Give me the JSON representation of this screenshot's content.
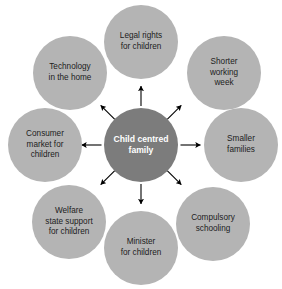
{
  "diagram": {
    "type": "radial-spoke",
    "title_hub": "Child centred\nfamily",
    "hub_name": "child-centred-family",
    "colors": {
      "hub_fill": "#7c7c7c",
      "hub_text": "#ffffff",
      "node_fill": "#b4b4b4",
      "node_text": "#1c1c1c",
      "arrow": "#000000",
      "background": "#ffffff"
    },
    "nodes": [
      {
        "id": "legal-rights-for-children",
        "label": "Legal rights\nfor children",
        "angle_deg": 90,
        "arrow_direction": "outward"
      },
      {
        "id": "shorter-working-week",
        "label": "Shorter\nworking\nweek",
        "angle_deg": 45,
        "arrow_direction": "outward"
      },
      {
        "id": "smaller-families",
        "label": "Smaller\nfamilies",
        "angle_deg": 0,
        "arrow_direction": "outward"
      },
      {
        "id": "compulsory-schooling",
        "label": "Compulsory\nschooling",
        "angle_deg": -45,
        "arrow_direction": "outward"
      },
      {
        "id": "minister-for-children",
        "label": "Minister\nfor children",
        "angle_deg": -90,
        "arrow_direction": "outward"
      },
      {
        "id": "welfare-state-support-for-children",
        "label": "Welfare\nstate support\nfor children",
        "angle_deg": -135,
        "arrow_direction": "outward"
      },
      {
        "id": "consumer-market-for-children",
        "label": "Consumer\nmarket for\nchildren",
        "angle_deg": 180,
        "arrow_direction": "outward"
      },
      {
        "id": "technology-in-the-home",
        "label": "Technology\nin the home",
        "angle_deg": 135,
        "arrow_direction": "outward"
      }
    ],
    "arrow_count": 8
  }
}
